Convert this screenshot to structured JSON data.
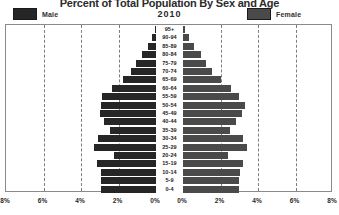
{
  "chart": {
    "title": "Percent of Total Population By Sex and Age",
    "year": "2010"
  },
  "legend": {
    "male_label": "Male",
    "female_label": "Female",
    "male_color": "#262626",
    "female_color": "#4a4a4a"
  },
  "chart_data": {
    "type": "bar",
    "subtype": "population-pyramid",
    "title": "Percent of Total Population By Sex and Age",
    "subtitle": "2010",
    "xlabel": "",
    "ylabel": "",
    "grid": true,
    "legend_position": "top",
    "categories": [
      "95+",
      "90-94",
      "85-89",
      "80-84",
      "75-79",
      "70-74",
      "65-69",
      "60-64",
      "55-59",
      "50-54",
      "45-49",
      "40-44",
      "35-39",
      "30-34",
      "25-29",
      "20-24",
      "15-19",
      "10-14",
      "5-9",
      "0-4"
    ],
    "axis_left_ticks": [
      "8%",
      "6%",
      "4%",
      "2%",
      "0%"
    ],
    "axis_right_ticks": [
      "0%",
      "2%",
      "4%",
      "6%",
      "8%"
    ],
    "xlim_left": [
      8,
      0
    ],
    "xlim_right": [
      0,
      8
    ],
    "units": "percent of total population",
    "series": [
      {
        "name": "Male",
        "color": "#262626",
        "values": [
          0.05,
          0.2,
          0.45,
          0.75,
          1.05,
          1.35,
          1.75,
          2.35,
          2.9,
          2.95,
          3.0,
          2.75,
          2.45,
          3.1,
          3.3,
          2.25,
          3.15,
          2.95,
          2.95,
          2.95
        ]
      },
      {
        "name": "Female",
        "color": "#4a4a4a",
        "values": [
          0.1,
          0.3,
          0.6,
          0.95,
          1.25,
          1.55,
          2.0,
          2.55,
          3.0,
          3.3,
          3.15,
          2.85,
          2.5,
          3.2,
          3.4,
          2.4,
          3.2,
          3.05,
          3.0,
          3.0
        ]
      }
    ]
  },
  "xaxis": {
    "ticks": [
      {
        "label": "8%",
        "pos": 0
      },
      {
        "label": "6%",
        "pos": 37.5
      },
      {
        "label": "4%",
        "pos": 75
      },
      {
        "label": "2%",
        "pos": 112.5
      },
      {
        "label": "0%",
        "pos": 150
      },
      {
        "label": "0%",
        "pos": 177
      },
      {
        "label": "2%",
        "pos": 214.5
      },
      {
        "label": "4%",
        "pos": 252
      },
      {
        "label": "6%",
        "pos": 289.5
      },
      {
        "label": "8%",
        "pos": 327
      }
    ]
  }
}
